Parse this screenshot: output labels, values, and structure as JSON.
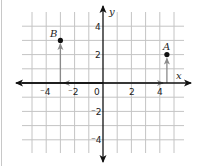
{
  "diagram": {
    "type": "coordinate-plane",
    "axes": {
      "x_label": "x",
      "y_label": "y",
      "origin_label": "0",
      "x_ticks": [
        {
          "value": -4,
          "label": "⁻4"
        },
        {
          "value": -2,
          "label": "⁻2"
        },
        {
          "value": 2,
          "label": "2"
        },
        {
          "value": 4,
          "label": "4"
        }
      ],
      "y_ticks": [
        {
          "value": 4,
          "label": "4"
        },
        {
          "value": 2,
          "label": "2"
        },
        {
          "value": -2,
          "label": "⁻2"
        },
        {
          "value": -4,
          "label": "⁻4"
        }
      ],
      "x_range": [
        -5,
        5
      ],
      "y_range": [
        -5,
        5
      ],
      "grid": true
    },
    "points": [
      {
        "name": "B",
        "x": -3,
        "y": 3
      },
      {
        "name": "A",
        "x": 4.5,
        "y": 2
      }
    ],
    "paths": [
      {
        "to": "B",
        "description": "from origin left along x-axis to -3, then up to B"
      },
      {
        "to": "A",
        "description": "from origin right along x-axis to 4.5, then up to A"
      }
    ],
    "colors": {
      "grid": "#c4c4c4",
      "axis": "#111111",
      "path": "#8a8a8a",
      "point": "#111111"
    }
  }
}
